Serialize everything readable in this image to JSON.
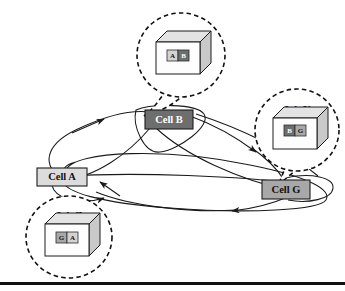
{
  "figure": {
    "background_color": "#ffffff",
    "line_color": "#1a1a1a",
    "bottom_rule": {
      "y": 282,
      "height": 3,
      "color": "#111111"
    }
  },
  "cells": [
    {
      "id": "cell-a",
      "label": "Cell A",
      "fill": "#dcdcdc",
      "text_color": "#111111",
      "x": 37,
      "y": 168,
      "w": 50,
      "h": 18
    },
    {
      "id": "cell-b",
      "label": "Cell B",
      "fill": "#6e6e6e",
      "text_color": "#ffffff",
      "x": 145,
      "y": 110,
      "w": 48,
      "h": 19
    },
    {
      "id": "cell-g",
      "label": "Cell G",
      "fill": "#a8a8a8",
      "text_color": "#111111",
      "x": 262,
      "y": 180,
      "w": 48,
      "h": 19
    }
  ],
  "jobs": [
    {
      "id": "job-x",
      "label": "Job X",
      "label_x": 181,
      "label_y": 34,
      "bubble": {
        "cx": 181,
        "cy": 55,
        "rx": 44,
        "ry": 42
      },
      "cube": {
        "x": 156,
        "y": 42,
        "w": 44,
        "h": 32,
        "depth": 11
      },
      "chips": [
        {
          "text": "A",
          "fill": "#d3d3d3",
          "text_color": "#111111"
        },
        {
          "text": "B",
          "fill": "#6e6e6e",
          "text_color": "#ffffff"
        }
      ]
    },
    {
      "id": "job-y",
      "label": "Job Y",
      "label_x": 297,
      "label_y": 109,
      "bubble": {
        "cx": 297,
        "cy": 130,
        "rx": 42,
        "ry": 41
      },
      "cube": {
        "x": 273,
        "y": 118,
        "w": 44,
        "h": 31,
        "depth": 11
      },
      "chips": [
        {
          "text": "B",
          "fill": "#6e6e6e",
          "text_color": "#ffffff"
        },
        {
          "text": "G",
          "fill": "#a8a8a8",
          "text_color": "#111111"
        }
      ]
    },
    {
      "id": "job-z",
      "label": "Job Z",
      "label_x": 69,
      "label_y": 215,
      "bubble": {
        "cx": 69,
        "cy": 237,
        "rx": 43,
        "ry": 41
      },
      "cube": {
        "x": 45,
        "y": 224,
        "w": 44,
        "h": 32,
        "depth": 11
      },
      "chips": [
        {
          "text": "G",
          "fill": "#a8a8a8",
          "text_color": "#111111"
        },
        {
          "text": "A",
          "fill": "#d3d3d3",
          "text_color": "#111111"
        }
      ]
    }
  ],
  "routes": [
    {
      "id": "route-job-x-a-to-b",
      "from": "Cell A",
      "to": "Cell B"
    },
    {
      "id": "route-job-x-b-loop",
      "from": "Cell B",
      "to": "Cell B"
    },
    {
      "id": "route-job-y-b-to-g",
      "from": "Cell B",
      "to": "Cell G"
    },
    {
      "id": "route-job-y-g-loop",
      "from": "Cell G",
      "to": "Cell G"
    },
    {
      "id": "route-job-z-g-to-a",
      "from": "Cell G",
      "to": "Cell A"
    },
    {
      "id": "route-job-z-a-loop",
      "from": "Cell A",
      "to": "Cell A"
    }
  ]
}
